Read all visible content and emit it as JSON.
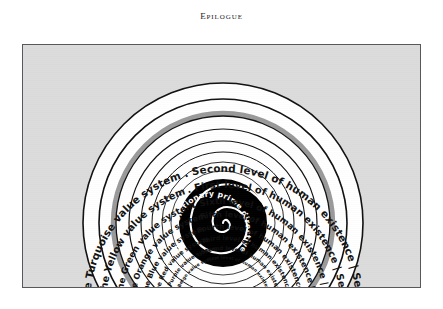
{
  "page": {
    "running_head": "Epilogue",
    "background_color": "#ffffff"
  },
  "figure": {
    "frame_background": "#dcdcdc",
    "frame_border_color": "#58585a",
    "center_disc_color": "#000000",
    "center_spiral_color": "#ffffff",
    "tier_divider_color": "#9a9a9a",
    "ring_fill_color": "#ffffff",
    "ring_stroke_color": "#111111",
    "center_label": "The evolutionary prime directive",
    "rings": [
      {
        "index": 0,
        "value_system": "The Turquoise value system",
        "level": "Second level of human existence",
        "tier": "Second Tier",
        "right_label": ". Second level of human existence | Second Tier"
      },
      {
        "index": 1,
        "value_system": "The Yellow value system",
        "level": "First level of human existence",
        "tier": "Second Tier",
        "right_label": ". First level of human existence | Second Tier"
      },
      {
        "index": 2,
        "value_system": "The Green value system",
        "level": "Sixth level of human existence",
        "tier": "First Tier",
        "right_label": ". Sixth level of human existence | First Tier"
      },
      {
        "index": 3,
        "value_system": "The Orange value system",
        "level": "Fifth level of human existence",
        "tier": "First Tier",
        "right_label": ". Fifth level of human existence | First Tier"
      },
      {
        "index": 4,
        "value_system": "The Blue value system",
        "level": "Fourth level of human existence",
        "tier": "First Tier",
        "right_label": ". Fourth level of human existence | First Tier"
      },
      {
        "index": 5,
        "value_system": "The Red value system",
        "level": "Third level of human existence",
        "tier": "First Tier",
        "right_label": ". Third level of human existence | First Tier"
      },
      {
        "index": 6,
        "value_system": "The Purple value system",
        "level": "Second level of human existence",
        "tier": "First Tier",
        "right_label": ". Second level of human existence | First Tier"
      },
      {
        "index": 7,
        "value_system": "The Beige value system",
        "level": "First level of human existence",
        "tier": "First Tier",
        "right_label": ". First level of human existence | First Tier"
      }
    ]
  }
}
